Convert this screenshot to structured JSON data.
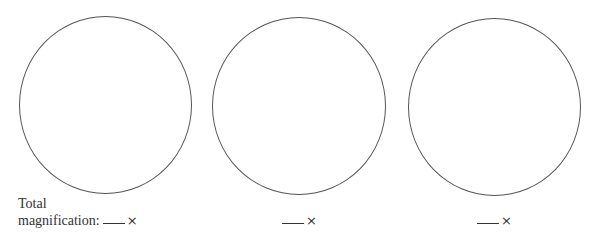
{
  "worksheet": {
    "fields": [
      {
        "prefix_line1": "Total",
        "prefix_line2": "magnification:",
        "suffix": "×"
      },
      {
        "prefix_line1": "",
        "prefix_line2": "",
        "suffix": "×"
      },
      {
        "prefix_line1": "",
        "prefix_line2": "",
        "suffix": "×"
      }
    ],
    "circles": [
      {
        "label": "field-of-view-1"
      },
      {
        "label": "field-of-view-2"
      },
      {
        "label": "field-of-view-3"
      }
    ],
    "line_color": "#555555"
  }
}
